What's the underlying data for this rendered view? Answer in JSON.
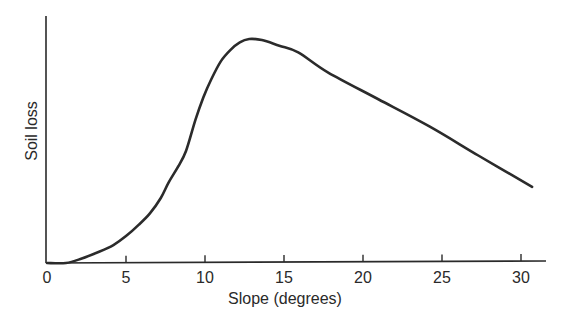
{
  "chart_data": {
    "type": "line",
    "title": "",
    "xlabel": "Slope (degrees)",
    "ylabel": "Soil loss",
    "xlim": [
      0,
      32
    ],
    "ylim": [
      0,
      100
    ],
    "x_ticks": [
      0,
      5,
      10,
      15,
      20,
      25,
      30
    ],
    "y_ticks": [],
    "grid": false,
    "legend": null,
    "series": [
      {
        "name": "Soil loss",
        "color": "#2b2b2b",
        "x": [
          0,
          1.2,
          2.2,
          3.3,
          4.2,
          5.0,
          5.8,
          6.5,
          7.2,
          7.7,
          8.3,
          8.8,
          9.4,
          9.9,
          10.4,
          11.0,
          11.6,
          12.2,
          12.8,
          13.6,
          14.7,
          15.9,
          17.8,
          21.0,
          24.2,
          27.3,
          30.7
        ],
        "values": [
          0,
          0,
          2,
          5,
          8,
          12,
          17,
          22,
          29,
          36,
          43,
          50,
          64,
          74,
          82,
          90,
          95,
          98.5,
          100,
          99.5,
          97,
          94,
          85,
          73,
          61,
          48,
          34
        ]
      }
    ]
  }
}
